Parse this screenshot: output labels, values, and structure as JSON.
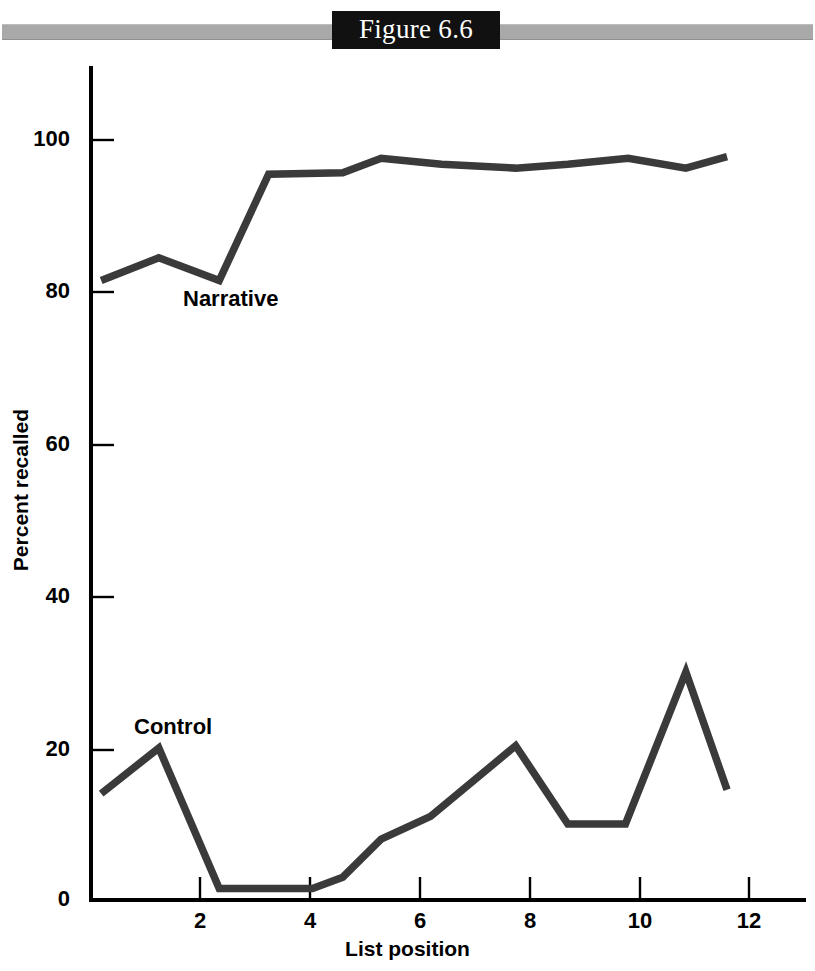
{
  "figure": {
    "title": "Figure 6.6",
    "banner_box_color": "#111111",
    "banner_bar_color": "#a9a9a9"
  },
  "chart_data": {
    "type": "line",
    "title": "Figure 6.6",
    "xlabel": "List position",
    "ylabel": "Percent recalled",
    "xlim": [
      0,
      13
    ],
    "ylim": [
      0,
      108
    ],
    "xticks": [
      2,
      4,
      6,
      8,
      10,
      12
    ],
    "yticks": [
      0,
      20,
      40,
      60,
      80,
      100
    ],
    "grid": false,
    "legend": "inline-labels",
    "line_color": "#3a3a3a",
    "series": [
      {
        "name": "Narrative",
        "label": "Narrative",
        "x": [
          0.2,
          1.25,
          2.35,
          3.25,
          4.6,
          5.3,
          6.4,
          7.75,
          8.7,
          9.8,
          10.85,
          11.6
        ],
        "values": [
          81.5,
          84.5,
          81.5,
          95.5,
          95.7,
          97.6,
          96.8,
          96.3,
          96.8,
          97.6,
          96.3,
          97.8
        ]
      },
      {
        "name": "Control",
        "label": "Control",
        "x": [
          0.2,
          1.25,
          2.35,
          4.05,
          4.6,
          5.3,
          6.2,
          7.75,
          8.7,
          9.75,
          10.85,
          11.6
        ],
        "values": [
          14.0,
          20.0,
          1.5,
          1.5,
          3.0,
          8.0,
          11.0,
          20.3,
          10.0,
          10.0,
          30.0,
          14.5
        ]
      }
    ]
  },
  "axis_labels": {
    "y": [
      "100",
      "80",
      "60",
      "40",
      "20",
      "0"
    ],
    "x": [
      "2",
      "4",
      "6",
      "8",
      "10",
      "12"
    ]
  }
}
